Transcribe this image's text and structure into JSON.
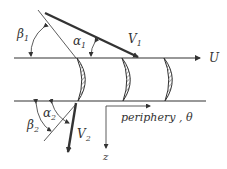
{
  "diagram": {
    "labels": {
      "beta1": "β",
      "beta1_sub": "1",
      "alpha1": "α",
      "alpha1_sub": "1",
      "V1": "V",
      "V1_sub": "1",
      "U": "U",
      "beta2": "β",
      "beta2_sub": "2",
      "alpha2": "α",
      "alpha2_sub": "2",
      "V2": "V",
      "V2_sub": "2",
      "periphery": "periphery , θ",
      "z": "z"
    },
    "colors": {
      "line": "#333333",
      "background": "#ffffff"
    }
  }
}
